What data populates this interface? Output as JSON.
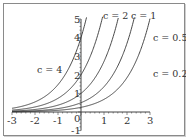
{
  "chart_data": {
    "type": "line",
    "title": "",
    "xlabel": "",
    "ylabel": "",
    "xlim": [
      -3,
      3
    ],
    "ylim": [
      -1,
      5
    ],
    "x_ticks": [
      "-3",
      "-2",
      "-1",
      "0",
      "1",
      "2",
      "3"
    ],
    "y_ticks": [
      "-1",
      "1",
      "2",
      "3",
      "4",
      "5"
    ],
    "grid": false,
    "legend": "inline labels",
    "function": "y = c * e^x",
    "series": [
      {
        "name": "c = 4",
        "c": 4
      },
      {
        "name": "c = 2",
        "c": 2
      },
      {
        "name": "c = 1",
        "c": 1
      },
      {
        "name": "c = 0.5",
        "c": 0.5
      },
      {
        "name": "c = 0.25",
        "c": 0.25
      }
    ],
    "colors": {
      "curve": "#333333",
      "axis": "#444444",
      "frame": "#8a8a8a"
    }
  },
  "labels": {
    "c4": "c = 4",
    "c2": "c = 2",
    "c1": "c = 1",
    "c05": "c = 0.5",
    "c025": "c = 0.25",
    "x": [
      "-3",
      "-2",
      "-1",
      "0",
      "1",
      "2",
      "3"
    ],
    "y": [
      "-1",
      "1",
      "2",
      "3",
      "4",
      "5"
    ]
  }
}
